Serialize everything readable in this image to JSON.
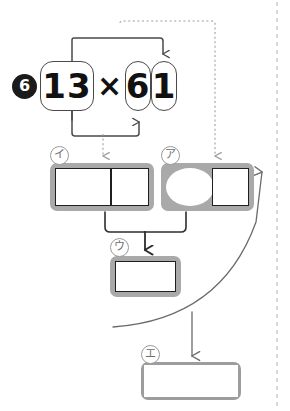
{
  "diagram": {
    "question_number": "6",
    "equation": {
      "multiplicand": "13",
      "operator": "×",
      "multiplier_tens_digit": "6",
      "multiplier_ones_digit": "1"
    },
    "answer_boxes": [
      {
        "id": "box-a",
        "label": "ア",
        "cells": 2,
        "cell_shapes": [
          "oval",
          "square"
        ]
      },
      {
        "id": "box-i",
        "label": "イ",
        "cells": 2,
        "cell_shapes": [
          "rect",
          "square"
        ]
      },
      {
        "id": "box-u",
        "label": "ウ",
        "cells": 1,
        "cell_shapes": [
          "rect"
        ]
      },
      {
        "id": "box-e",
        "label": "エ",
        "cells": 1,
        "cell_shapes": [
          "rect"
        ]
      }
    ],
    "colors": {
      "box_frame": "#a9a9a9",
      "cell_border": "#1f1f1f",
      "marker_fill": "#1b1b1b",
      "solid_arrow": "#4a4a4a",
      "dotted_arrow": "#9e9e9e",
      "fold_line": "#bdbdbd",
      "label_text": "#6f6f6f"
    },
    "connectors": [
      {
        "name": "ones-digit-to-multiplicand",
        "style": "solid",
        "from": "multiplier_ones_digit",
        "to": "multiplicand",
        "direction": "up-left-hook"
      },
      {
        "name": "tens-digit-to-multiplicand",
        "style": "solid",
        "from": "multiplier_tens_digit",
        "to": "multiplicand",
        "direction": "down-left-hook"
      },
      {
        "name": "multiplicand-to-box-i",
        "style": "dotted",
        "from": "multiplicand",
        "to": "box-i",
        "direction": "down"
      },
      {
        "name": "multiplier-to-box-a",
        "style": "dotted",
        "from": "multiplier",
        "to": "box-a",
        "direction": "right-down"
      },
      {
        "name": "box-i-and-box-a-to-box-u",
        "style": "solid",
        "from": "box-i,box-a",
        "to": "box-u",
        "direction": "merge-down"
      },
      {
        "name": "box-u-to-box-e",
        "style": "solid",
        "from": "box-u",
        "to": "box-e",
        "direction": "curve-down"
      },
      {
        "name": "box-e-back-to-box-a",
        "style": "solid",
        "from": "box-e",
        "to": "box-a",
        "direction": "curve-up-right"
      }
    ],
    "fold_line": {
      "orientation": "vertical",
      "position_x": 277,
      "style": "dashed"
    }
  }
}
